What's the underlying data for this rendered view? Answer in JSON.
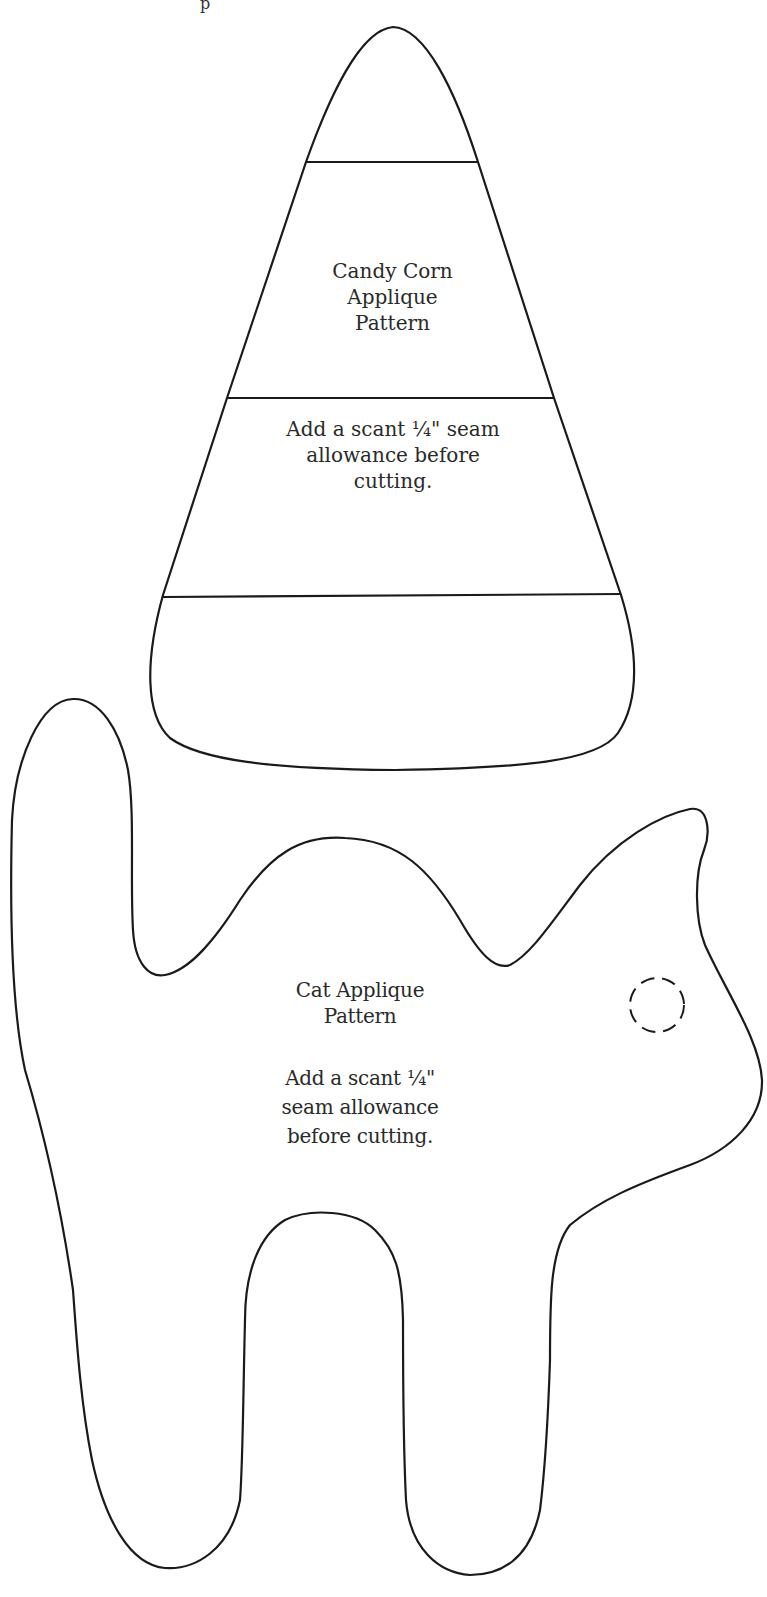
{
  "document": {
    "top_fragment": "p",
    "candy_corn": {
      "title": "Candy Corn\nApplique\nPattern",
      "note": "Add a scant ¼\" seam\nallowance before\ncutting.",
      "stroke_color": "#1a1a1a"
    },
    "cat": {
      "title": "Cat Applique\nPattern",
      "note": "Add a scant ¼\"\nseam allowance\nbefore cutting.",
      "stroke_color": "#1a1a1a",
      "eye": "dashed-circle"
    },
    "background_color": "#ffffff"
  }
}
